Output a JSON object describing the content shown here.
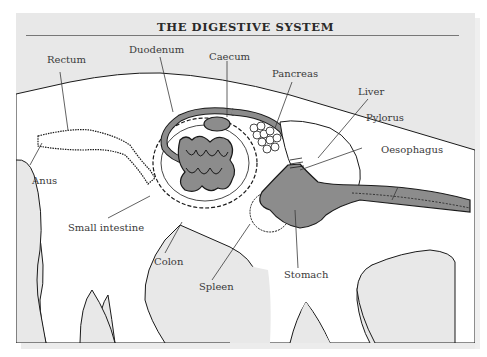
{
  "title": "THE DIGESTIVE SYSTEM",
  "labels": {
    "rectum": "Rectum",
    "duodenum": "Duodenum",
    "caecum": "Caecum",
    "pancreas": "Pancreas",
    "liver": "Liver",
    "pylorus": "Pylorus",
    "oesophagus": "Oesophagus",
    "anus": "Anus",
    "small_intestine": "Small intestine",
    "colon": "Colon",
    "spleen": "Spleen",
    "stomach": "Stomach"
  },
  "colors": {
    "panel_background": "#e8e8e8",
    "body_fill": "#ffffff",
    "organ_fill": "#8c8c8c",
    "outline": "#1a1a1a",
    "label_text": "#3a3a3a"
  }
}
